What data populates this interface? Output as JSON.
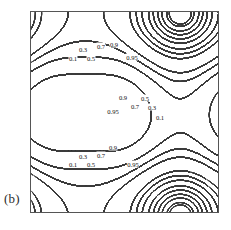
{
  "figure": {
    "panel_label": "(b)",
    "type": "contour-plot"
  },
  "chart_data": {
    "type": "contour",
    "title": "",
    "subtitle": "",
    "xlabel": "",
    "ylabel": "",
    "grid": false,
    "legend": "none",
    "axis_ticks": false,
    "frame": true,
    "xlim": [
      0,
      1
    ],
    "ylim": [
      0,
      1
    ],
    "contour_levels": [
      0.1,
      0.3,
      0.5,
      0.7,
      0.9,
      0.95
    ],
    "line_color": "#3b3b3b",
    "frame_color": "#555555",
    "background_color": "#ffffff",
    "maxima": [
      {
        "name": "top-left-peak",
        "x": 0.29,
        "y": 0.79,
        "clipped": false
      },
      {
        "name": "top-right-peak",
        "x": 0.79,
        "y": 1.02,
        "clipped": true
      },
      {
        "name": "mid-right-peak",
        "x": 0.79,
        "y": 0.5,
        "clipped": false
      },
      {
        "name": "bottom-left-peak",
        "x": 0.29,
        "y": 0.22,
        "clipped": false
      },
      {
        "name": "bottom-right-peak",
        "x": 0.79,
        "y": -0.03,
        "clipped": true
      }
    ],
    "saddle_islands": [
      {
        "name": "left-mid-island",
        "x": 0.1,
        "y": 0.5,
        "level": 0.95
      },
      {
        "name": "center-mid-island",
        "x": 0.4,
        "y": 0.5,
        "level": 0.95
      },
      {
        "name": "center-upper-island",
        "x": 0.57,
        "y": 0.79,
        "level": 0.95
      },
      {
        "name": "right-upper-island",
        "x": 1.0,
        "y": 0.79,
        "level": 0.95
      },
      {
        "name": "center-lower-island",
        "x": 0.57,
        "y": 0.22,
        "level": 0.95
      },
      {
        "name": "right-lower-island",
        "x": 1.0,
        "y": 0.22,
        "level": 0.95
      }
    ],
    "labels": [
      {
        "text": "0.1",
        "x": 72,
        "y": 57
      },
      {
        "text": "0.3",
        "x": 82,
        "y": 48
      },
      {
        "text": "0.5",
        "x": 90,
        "y": 57
      },
      {
        "text": "0.7",
        "x": 100,
        "y": 45
      },
      {
        "text": "0.9",
        "x": 113,
        "y": 43
      },
      {
        "text": "0.95",
        "x": 131,
        "y": 56
      },
      {
        "text": "0.9",
        "x": 122,
        "y": 96
      },
      {
        "text": "0.95",
        "x": 112,
        "y": 110
      },
      {
        "text": "0.7",
        "x": 134,
        "y": 105
      },
      {
        "text": "0.5",
        "x": 144,
        "y": 97
      },
      {
        "text": "0.3",
        "x": 151,
        "y": 106
      },
      {
        "text": "0.1",
        "x": 159,
        "y": 116
      },
      {
        "text": "0.1",
        "x": 72,
        "y": 163
      },
      {
        "text": "0.3",
        "x": 82,
        "y": 155
      },
      {
        "text": "0.5",
        "x": 90,
        "y": 163
      },
      {
        "text": "0.7",
        "x": 100,
        "y": 154
      },
      {
        "text": "0.9",
        "x": 112,
        "y": 146
      },
      {
        "text": "0.95",
        "x": 132,
        "y": 163
      }
    ]
  }
}
